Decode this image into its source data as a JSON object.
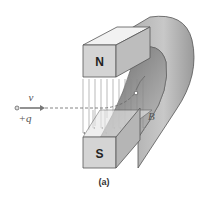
{
  "figure": {
    "caption": "(a)",
    "magnet": {
      "north_label": "N",
      "south_label": "S"
    },
    "field_label": "B",
    "particle": {
      "velocity_label": "v",
      "charge_label": "+q"
    },
    "colors": {
      "magnet_face": "#d4d4d4",
      "magnet_top": "#f2f2f2",
      "magnet_side": "#b8b8b8",
      "field_lines": "#8a8a8a",
      "path": "#666666",
      "arrow": "#777777"
    }
  }
}
